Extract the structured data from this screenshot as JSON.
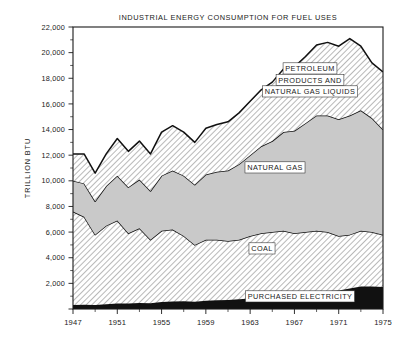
{
  "chart_data": {
    "type": "area",
    "title": "INDUSTRIAL ENERGY CONSUMPTION FOR FUEL USES",
    "xlabel": "",
    "ylabel": "TRILLION BTU",
    "stacked": true,
    "grid": false,
    "legend_position": "inline-annotations",
    "xlim": [
      1947,
      1975
    ],
    "ylim": [
      0,
      22000
    ],
    "yticks": [
      0,
      2000,
      4000,
      6000,
      8000,
      10000,
      12000,
      14000,
      16000,
      18000,
      20000,
      22000
    ],
    "ytick_labels": [
      "",
      "2,000",
      "4,000",
      "6,000",
      "8,000",
      "10,000",
      "12,000",
      "14,000",
      "16,000",
      "18,000",
      "20,000",
      "22,000"
    ],
    "xticks": [
      1947,
      1951,
      1955,
      1959,
      1963,
      1967,
      1971,
      1975
    ],
    "xtick_labels": [
      "1947",
      "1951",
      "1955",
      "1959",
      "1963",
      "1967",
      "1971",
      "1975"
    ],
    "x": [
      1947,
      1948,
      1949,
      1950,
      1951,
      1952,
      1953,
      1954,
      1955,
      1956,
      1957,
      1958,
      1959,
      1960,
      1961,
      1962,
      1963,
      1964,
      1965,
      1966,
      1967,
      1968,
      1969,
      1970,
      1971,
      1972,
      1973,
      1974,
      1975
    ],
    "series": [
      {
        "name": "PURCHASED ELECTRICITY",
        "fill": "#111111",
        "pattern": "solid-black",
        "values": [
          320,
          330,
          310,
          370,
          420,
          430,
          470,
          450,
          540,
          580,
          600,
          570,
          640,
          680,
          700,
          760,
          820,
          900,
          970,
          1060,
          1120,
          1230,
          1340,
          1400,
          1450,
          1600,
          1760,
          1750,
          1720
        ]
      },
      {
        "name": "COAL",
        "fill": "#ffffff",
        "pattern": "diagonal-hatch-light",
        "values": [
          7280,
          6870,
          5490,
          6130,
          6480,
          5470,
          5830,
          4950,
          5560,
          5620,
          5100,
          4430,
          4760,
          4720,
          4600,
          4640,
          4880,
          5000,
          5030,
          5040,
          4780,
          4770,
          4760,
          4600,
          4250,
          4200,
          4340,
          4250,
          4080
        ]
      },
      {
        "name": "NATURAL GAS",
        "fill": "#c9c9c9",
        "pattern": "solid-gray",
        "values": [
          2400,
          2600,
          2600,
          3100,
          3500,
          3600,
          3800,
          3800,
          4300,
          4600,
          4700,
          4700,
          5100,
          5300,
          5500,
          5900,
          6300,
          6800,
          7100,
          7700,
          8000,
          8500,
          9000,
          9100,
          9100,
          9300,
          9400,
          8900,
          8200
        ]
      },
      {
        "name": "PETROLEUM PRODUCTS AND NATURAL GAS LIQUIDS",
        "fill": "#ffffff",
        "pattern": "diagonal-hatch-light",
        "values": [
          2100,
          2300,
          2200,
          2500,
          2900,
          2800,
          3000,
          2900,
          3400,
          3500,
          3400,
          3300,
          3600,
          3700,
          3800,
          4000,
          4200,
          4400,
          4600,
          4900,
          5000,
          5200,
          5500,
          5700,
          5700,
          6000,
          5000,
          4300,
          4500
        ]
      }
    ],
    "annotations": [
      {
        "text": "PETROLEUM PRODUCTS AND NATURAL GAS LIQUIDS",
        "series": "PETROLEUM PRODUCTS AND NATURAL GAS LIQUIDS"
      },
      {
        "text": "NATURAL GAS",
        "series": "NATURAL GAS"
      },
      {
        "text": "COAL",
        "series": "COAL"
      },
      {
        "text": "PURCHASED ELECTRICITY",
        "series": "PURCHASED ELECTRICITY"
      }
    ]
  },
  "labels": {
    "title": "INDUSTRIAL ENERGY CONSUMPTION FOR FUEL USES",
    "y_axis_title": "TRILLION BTU",
    "petroleum_line1": "PETROLEUM",
    "petroleum_line2": "PRODUCTS AND",
    "petroleum_line3": "NATURAL GAS LIQUIDS",
    "natural_gas": "NATURAL GAS",
    "coal": "COAL",
    "purchased_electricity": "PURCHASED ELECTRICITY"
  }
}
